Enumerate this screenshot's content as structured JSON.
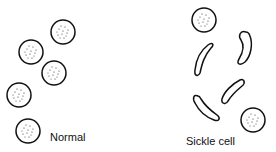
{
  "labels": {
    "normal": "Normal",
    "sickle": "Sickle cell"
  },
  "colors": {
    "outline": "#111111",
    "background": "#ffffff"
  },
  "normal_cells": [
    {
      "cx": 63,
      "cy": 32,
      "r": 12
    },
    {
      "cx": 31,
      "cy": 52,
      "r": 12
    },
    {
      "cx": 54,
      "cy": 73,
      "r": 12
    },
    {
      "cx": 19,
      "cy": 95,
      "r": 12
    },
    {
      "cx": 28,
      "cy": 131,
      "r": 12
    }
  ],
  "sickle_panel": {
    "round_cells": [
      {
        "cx": 204,
        "cy": 20,
        "r": 12
      },
      {
        "cx": 253,
        "cy": 120,
        "r": 12
      }
    ],
    "sickle_cells_count": 5
  }
}
